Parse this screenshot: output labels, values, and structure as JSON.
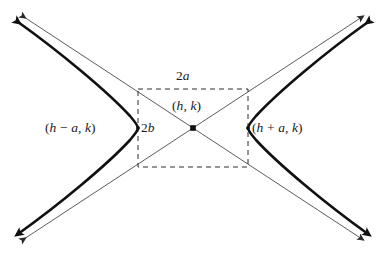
{
  "figure": {
    "kind": "hyperbola-diagram",
    "background_color": "#ffffff",
    "curve_color": "#111111",
    "asymptote_color": "#555555",
    "dashed_color": "#333333",
    "labels": {
      "vertex_left": "(h − a, k)",
      "vertex_right": "(h + a, k)",
      "center": "(h, k)",
      "transverse_axis": "2a",
      "conjugate_axis": "2b"
    },
    "geometry": {
      "center": {
        "x": 193,
        "y": 128
      },
      "semi_transverse_a_px": 55,
      "semi_conjugate_b_px": 39,
      "rectangle": {
        "left": 138,
        "top": 89,
        "right": 248,
        "bottom": 167
      },
      "vertex_left_point": {
        "x": 138,
        "y": 128
      },
      "vertex_right_point": {
        "x": 248,
        "y": 128
      }
    },
    "elements": {
      "branch_left_name": "hyperbola-branch-left",
      "branch_right_name": "hyperbola-branch-right",
      "asymptote_rising_name": "asymptote-rising",
      "asymptote_falling_name": "asymptote-falling",
      "rectangle_name": "fundamental-rectangle"
    }
  }
}
